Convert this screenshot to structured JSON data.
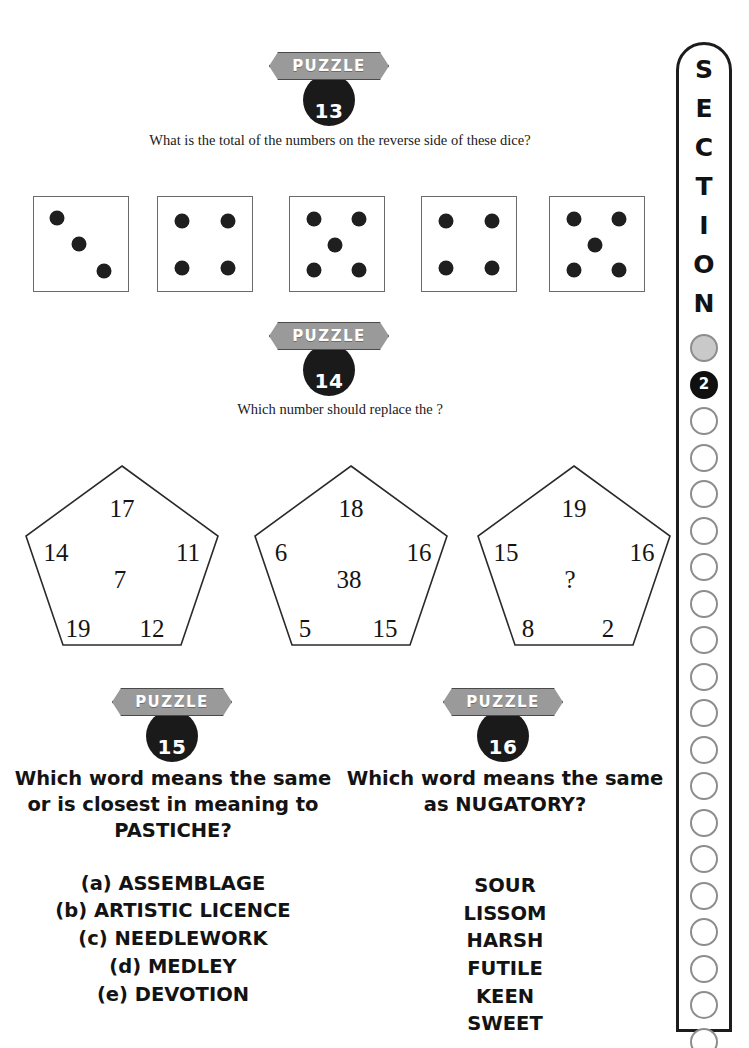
{
  "puzzles": [
    {
      "badge_label": "PUZZLE",
      "number": "13",
      "question": "What is the total of the numbers on the reverse side of these dice?",
      "dice": [
        {
          "pips": 3,
          "layout": "diagonal-3"
        },
        {
          "pips": 4,
          "layout": "corners-4"
        },
        {
          "pips": 5,
          "layout": "five"
        },
        {
          "pips": 4,
          "layout": "corners-4"
        },
        {
          "pips": 5,
          "layout": "five"
        }
      ]
    },
    {
      "badge_label": "PUZZLE",
      "number": "14",
      "question": "Which number should replace the ?",
      "pentagons": [
        {
          "top": "17",
          "left": "14",
          "right": "11",
          "center": "7",
          "bottom_left": "19",
          "bottom_right": "12"
        },
        {
          "top": "18",
          "left": "6",
          "right": "16",
          "center": "38",
          "bottom_left": "5",
          "bottom_right": "15"
        },
        {
          "top": "19",
          "left": "15",
          "right": "16",
          "center": "?",
          "bottom_left": "8",
          "bottom_right": "2"
        }
      ]
    },
    {
      "badge_label": "PUZZLE",
      "number": "15",
      "question_lines": [
        "Which word means the same",
        "or is closest in meaning to",
        "PASTICHE?"
      ],
      "options": [
        "(a) ASSEMBLAGE",
        "(b) ARTISTIC LICENCE",
        "(c) NEEDLEWORK",
        "(d) MEDLEY",
        "(e) DEVOTION"
      ]
    },
    {
      "badge_label": "PUZZLE",
      "number": "16",
      "question_lines": [
        "Which word means the same",
        "as NUGATORY?"
      ],
      "options": [
        "SOUR",
        "LISSOM",
        "HARSH",
        "FUTILE",
        "KEEN",
        "SWEET"
      ]
    }
  ],
  "sidebar": {
    "letters": [
      "S",
      "E",
      "C",
      "T",
      "I",
      "O",
      "N"
    ],
    "current_section": "2",
    "dots": [
      {
        "state": "gray",
        "label": ""
      },
      {
        "state": "current",
        "label": "2"
      },
      {
        "state": "empty",
        "label": ""
      },
      {
        "state": "empty",
        "label": ""
      },
      {
        "state": "empty",
        "label": ""
      },
      {
        "state": "empty",
        "label": ""
      },
      {
        "state": "empty",
        "label": ""
      },
      {
        "state": "empty",
        "label": ""
      },
      {
        "state": "empty",
        "label": ""
      },
      {
        "state": "empty",
        "label": ""
      },
      {
        "state": "empty",
        "label": ""
      },
      {
        "state": "empty",
        "label": ""
      },
      {
        "state": "empty",
        "label": ""
      },
      {
        "state": "empty",
        "label": ""
      },
      {
        "state": "empty",
        "label": ""
      },
      {
        "state": "empty",
        "label": ""
      },
      {
        "state": "empty",
        "label": ""
      },
      {
        "state": "empty",
        "label": ""
      },
      {
        "state": "empty",
        "label": ""
      },
      {
        "state": "empty",
        "label": ""
      },
      {
        "state": "empty",
        "label": ""
      }
    ]
  },
  "colors": {
    "badge_plate": "#9a9a9a",
    "badge_circle": "#1a1a1a",
    "pip": "#1f1f1f",
    "die_border": "#6a6a6a",
    "sidebar_border": "#1c1c1c",
    "dot_empty_border": "#8d8d8d",
    "dot_gray_fill": "#c9c9c9",
    "text": "#131313"
  }
}
